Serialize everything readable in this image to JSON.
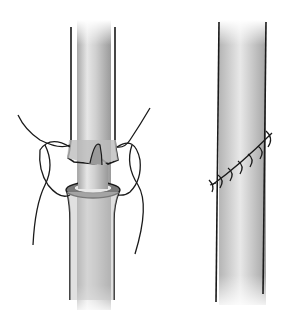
{
  "illustration": {
    "background": "#ffffff",
    "colors": {
      "outline": "#1a1a1a",
      "tube_light": "#f2f2f2",
      "tube_mid": "#c4c4c4",
      "tube_dark": "#9a9a9a",
      "cuff_dark": "#7a7a7a"
    },
    "left_figure": {
      "label": ""
    },
    "right_figure": {
      "label": ""
    }
  }
}
